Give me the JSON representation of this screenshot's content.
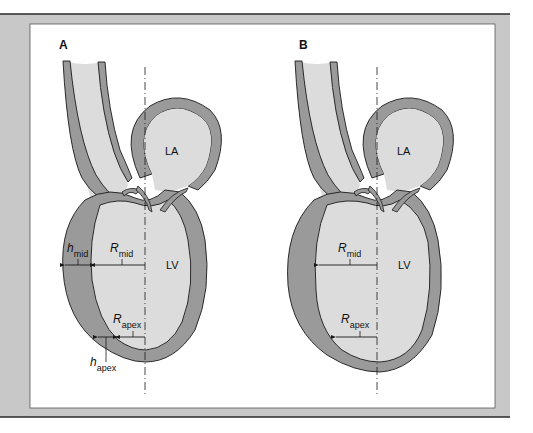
{
  "panels": [
    {
      "id": "A",
      "label": "A",
      "chambers": {
        "atrium": "LA",
        "ventricle": "LV"
      },
      "measurements": {
        "h_mid": {
          "symbol": "h",
          "subscript": "mid"
        },
        "R_mid": {
          "symbol": "R",
          "subscript": "mid"
        },
        "R_apex": {
          "symbol": "R",
          "subscript": "apex"
        },
        "h_apex": {
          "symbol": "h",
          "subscript": "apex"
        }
      }
    },
    {
      "id": "B",
      "label": "B",
      "chambers": {
        "atrium": "LA",
        "ventricle": "LV"
      },
      "measurements": {
        "R_mid": {
          "symbol": "R",
          "subscript": "mid"
        },
        "R_apex": {
          "symbol": "R",
          "subscript": "apex"
        }
      }
    }
  ],
  "colors": {
    "frame": "#c8c8c8",
    "frame_line": "#2a2a2a",
    "panel_bg": "#ffffff",
    "wall": "#9a9a9a",
    "cavity": "#dcdcdc",
    "outline": "#1a1a1a"
  }
}
